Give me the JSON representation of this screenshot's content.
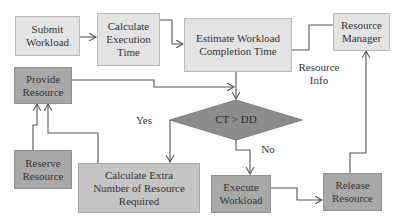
{
  "diagram": {
    "nodes": {
      "submit_workload": "Submit Workload",
      "calculate_execution_time": "Calculate Execution Time",
      "estimate_completion_time": "Estimate Workload Completion Time",
      "resource_manager": "Resource Manager",
      "provide_resource": "Provide Resource",
      "decision": "CT > DD",
      "reserve_resource": "Reserve Resource",
      "calculate_extra": "Calculate Extra Number of Resource Required",
      "execute_workload": "Execute Workload",
      "release_resource": "Release Resource"
    },
    "edge_labels": {
      "resource_info": "Resource Info",
      "yes": "Yes",
      "no": "No"
    },
    "colors": {
      "light_box": "#e3e3e3",
      "mid_box": "#a8a8a8",
      "diamond": "#8c8c8c",
      "line": "#555555"
    }
  }
}
